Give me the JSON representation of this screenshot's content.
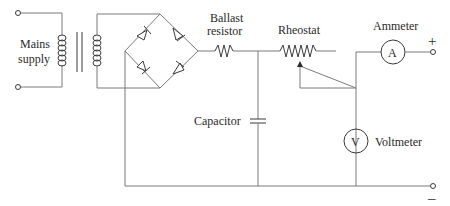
{
  "diagram": {
    "labels": {
      "mains": [
        "Mains",
        "supply"
      ],
      "ballast": [
        "Ballast",
        "resistor"
      ],
      "rheostat": "Rheostat",
      "ammeter": "Ammeter",
      "ammeter_symbol": "A",
      "capacitor": "Capacitor",
      "voltmeter": "Voltmeter",
      "voltmeter_symbol": "V",
      "positive": "+",
      "negative": "–"
    },
    "components": [
      "mains-supply",
      "transformer",
      "bridge-rectifier",
      "ballast-resistor",
      "capacitor",
      "rheostat",
      "ammeter",
      "voltmeter",
      "output-terminals"
    ],
    "colors": {
      "wire": "#7a7a7a",
      "component": "#3a3a3a",
      "text": "#2a2a2a"
    }
  }
}
